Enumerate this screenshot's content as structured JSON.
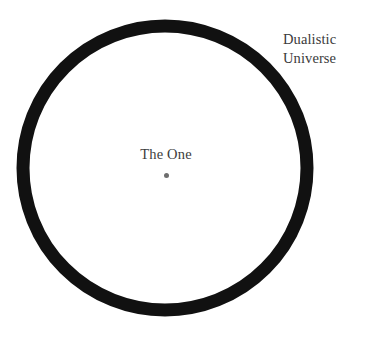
{
  "diagram": {
    "background_color": "#ffffff",
    "shapes": {
      "circle": {
        "name": "dualistic-universe-boundary",
        "center_x": 165,
        "center_y": 168,
        "outer_diameter": 297,
        "stroke_width": 13,
        "stroke_color": "#111111",
        "fill": "none"
      },
      "center_point": {
        "name": "the-one-point",
        "center_x": 176,
        "center_y": 177,
        "diameter": 5,
        "color": "#6e6e6e"
      }
    },
    "labels": {
      "outer": {
        "line1": "Dualistic",
        "line2": "Universe",
        "color": "#3a3a3a",
        "x": 283,
        "y": 30
      },
      "center": {
        "text": "The One",
        "color": "#3d3d3d",
        "x": 166,
        "y": 155
      }
    }
  }
}
